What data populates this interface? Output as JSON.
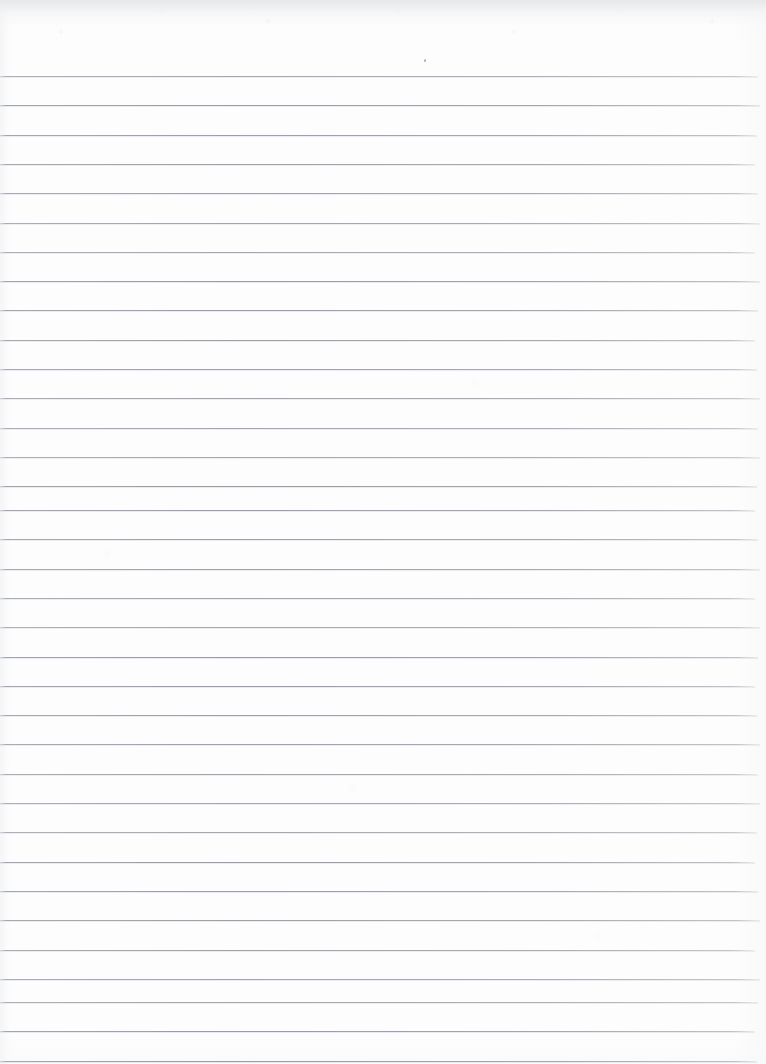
{
  "document": {
    "kind": "scanned-ruled-paper",
    "title": "Blank ruled notebook page",
    "page_width": 766,
    "page_height": 1064,
    "background_color": "#fdfdfd",
    "paper_tone": "#ffffff",
    "visible_text": "",
    "content_note": "No handwriting, printing or typed text is present on the page."
  },
  "ruling": {
    "line_color": "#9a9fab",
    "line_thickness": 1,
    "line_spacing": 29.3,
    "first_line_y": 76,
    "line_count": 35,
    "line_start_x": 0,
    "line_end_x": 758,
    "top_margin_height": 76,
    "has_vertical_margin_rule": false,
    "line_y_positions": [
      76,
      105.3,
      134.6,
      163.9,
      193.2,
      222.5,
      251.8,
      281.1,
      310.4,
      339.7,
      369,
      398.3,
      427.6,
      456.9,
      486.2,
      510,
      539.3,
      568.6,
      597.9,
      627.2,
      656.5,
      685.8,
      715.1,
      744.4,
      773.7,
      803,
      832.3,
      861.6,
      890.9,
      920.2,
      949.5,
      978.8,
      1002,
      1031.3,
      1060.6
    ]
  },
  "marks": {
    "speck": {
      "label": "ink-speck",
      "x": 424,
      "y": 59,
      "color": "#b0aab0"
    }
  },
  "edges": {
    "top_shade_color": "#e2e4e7",
    "top_shade_height": 26,
    "left_edge_tint": "#f3f4f6",
    "right_edge_tint": "#f6f7f8"
  }
}
